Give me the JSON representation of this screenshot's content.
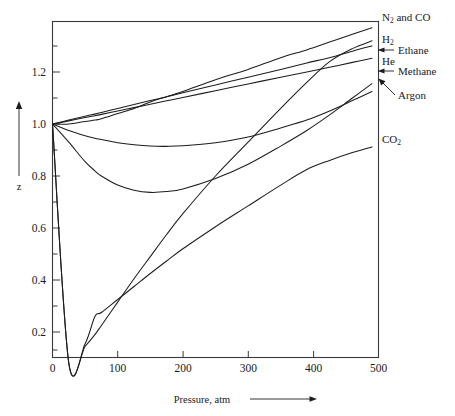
{
  "chart_data": {
    "type": "line",
    "title": "",
    "xlabel": "Pressure, atm",
    "ylabel": "z",
    "xlim": [
      0,
      500
    ],
    "ylim": [
      0.05,
      1.37
    ],
    "grid": false,
    "legend_position": "right-inline-labels",
    "xticks": [
      0,
      100,
      200,
      300,
      400,
      500
    ],
    "xtick_labels": [
      "0",
      "100",
      "200",
      "300",
      "400",
      "500"
    ],
    "yticks": [
      0.2,
      0.4,
      0.6,
      0.8,
      1.0,
      1.2
    ],
    "ytick_labels": [
      "0.2",
      "0.4",
      "0.6",
      "0.8",
      "1.0",
      "1.2"
    ],
    "minor_ytick_step": 0.1,
    "x": [
      0,
      25,
      50,
      65,
      75,
      100,
      125,
      150,
      175,
      200,
      250,
      300,
      350,
      390,
      425,
      460,
      490
    ],
    "series": [
      {
        "name": "N2 and CO",
        "label": "N₂ and CO",
        "label_html": "N<sub>2</sub> and CO",
        "leader": "none",
        "values": [
          1.0,
          1.0,
          1.01,
          1.015,
          1.02,
          1.04,
          1.06,
          1.085,
          1.105,
          1.125,
          1.17,
          1.21,
          1.255,
          1.285,
          1.315,
          1.345,
          1.37
        ]
      },
      {
        "name": "H2",
        "label": "H₂",
        "label_html": "H<sub>2</sub>",
        "leader": "none",
        "values": [
          1.0,
          1.015,
          1.03,
          1.038,
          1.044,
          1.06,
          1.075,
          1.09,
          1.105,
          1.12,
          1.15,
          1.18,
          1.21,
          1.235,
          1.255,
          1.28,
          1.3
        ]
      },
      {
        "name": "He",
        "label": "He",
        "label_html": "He",
        "leader": "none",
        "values": [
          1.0,
          1.012,
          1.025,
          1.032,
          1.037,
          1.05,
          1.063,
          1.076,
          1.089,
          1.102,
          1.128,
          1.154,
          1.18,
          1.2,
          1.218,
          1.237,
          1.253
        ]
      },
      {
        "name": "Ethane",
        "label": "Ethane",
        "label_html": "Ethane",
        "leader": "arrow",
        "values": [
          1.0,
          0.08,
          0.145,
          0.19,
          0.225,
          0.315,
          0.405,
          0.49,
          0.575,
          0.655,
          0.8,
          0.93,
          1.06,
          1.16,
          1.24,
          1.29,
          1.32
        ]
      },
      {
        "name": "Methane",
        "label": "Methane",
        "label_html": "Methane",
        "leader": "arrow",
        "values": [
          1.0,
          0.93,
          0.855,
          0.82,
          0.8,
          0.765,
          0.745,
          0.737,
          0.74,
          0.75,
          0.79,
          0.845,
          0.915,
          0.975,
          1.035,
          1.1,
          1.155
        ]
      },
      {
        "name": "Argon",
        "label": "Argon",
        "label_html": "Argon",
        "leader": "arrow",
        "values": [
          1.0,
          0.975,
          0.955,
          0.945,
          0.94,
          0.928,
          0.92,
          0.915,
          0.914,
          0.916,
          0.928,
          0.95,
          0.985,
          1.015,
          1.05,
          1.09,
          1.125
        ]
      },
      {
        "name": "CO2",
        "label": "CO₂",
        "label_html": "CO<sub>2</sub>",
        "leader": "none",
        "values": [
          1.0,
          0.08,
          0.155,
          0.26,
          0.275,
          0.325,
          0.375,
          0.425,
          0.473,
          0.52,
          0.605,
          0.685,
          0.765,
          0.825,
          0.86,
          0.89,
          0.912
        ]
      }
    ],
    "notes": {
      "ethane_minimum": {
        "pressure": 25,
        "z": 0.08
      },
      "co2_minimum": {
        "pressure": 65,
        "z": 0.26
      },
      "methane_minimum": {
        "pressure": 150,
        "z": 0.737
      },
      "argon_minimum": {
        "pressure": 165,
        "z": 0.914
      },
      "convergence_point": {
        "pressure": 390,
        "z": 1.02
      }
    }
  },
  "axes": {
    "x_axis_label": "Pressure, atm",
    "y_axis_label": "z",
    "x_tick_labels": [
      "0",
      "100",
      "200",
      "300",
      "400",
      "500"
    ],
    "y_tick_labels": [
      "0.2",
      "0.4",
      "0.6",
      "0.8",
      "1.0",
      "1.2"
    ]
  },
  "colors": {
    "background": "#ffffff",
    "curve": "#1d1d1d",
    "frame": "#3a3a3a",
    "text": "#1a1a1a"
  }
}
